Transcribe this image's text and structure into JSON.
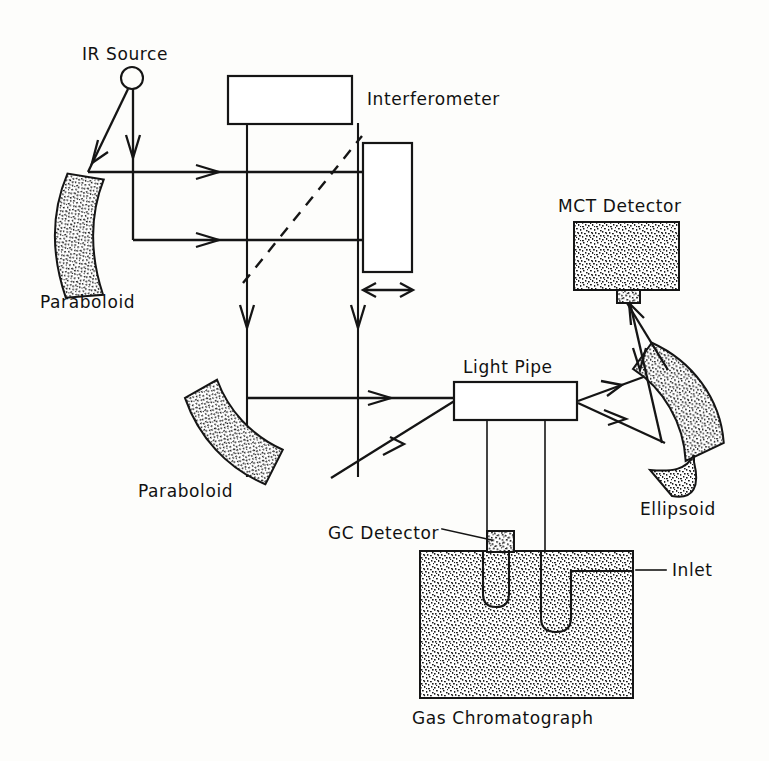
{
  "figure": {
    "background_color": "#fdfdfb",
    "ink_color": "#151515",
    "width": 769,
    "height": 761
  },
  "labels": {
    "ir_source": "IR Source",
    "paraboloid_top": "Paraboloid",
    "interferometer": "Interferometer",
    "mct_detector": "MCT Detector",
    "light_pipe": "Light Pipe",
    "ellipsoid": "Ellipsoid",
    "paraboloid_bottom": "Paraboloid",
    "gc_detector": "GC Detector",
    "inlet": "Inlet",
    "gas_chromatograph": "Gas Chromatograph"
  },
  "components": [
    {
      "name": "ir-source",
      "label": "IR Source",
      "kind": "source",
      "shape": "circle",
      "center": [
        132,
        78
      ],
      "radius": 11
    },
    {
      "name": "paraboloid-top",
      "label": "Paraboloid",
      "kind": "mirror",
      "shape": "curved-band-shaded"
    },
    {
      "name": "interferometer",
      "label": "Interferometer",
      "kind": "module",
      "shape": "rectangle-open",
      "rect": [
        228,
        76,
        124,
        48
      ]
    },
    {
      "name": "moving-mirror",
      "label": "",
      "kind": "translating-mirror",
      "shape": "rectangle-open",
      "rect": [
        363,
        143,
        49,
        129
      ],
      "motion": "bidirectional-horizontal"
    },
    {
      "name": "beam-splitter",
      "label": "",
      "kind": "beamsplitter",
      "shape": "dashed-diagonal-line"
    },
    {
      "name": "paraboloid-bottom",
      "label": "Paraboloid",
      "kind": "mirror",
      "shape": "curved-band-shaded"
    },
    {
      "name": "light-pipe",
      "label": "Light Pipe",
      "kind": "cell",
      "shape": "rectangle-open",
      "rect": [
        454,
        382,
        123,
        38
      ]
    },
    {
      "name": "ellipsoid",
      "label": "Ellipsoid",
      "kind": "mirror",
      "shape": "curved-band-shaded"
    },
    {
      "name": "mct-detector",
      "label": "MCT Detector",
      "kind": "detector",
      "shape": "rectangle-shaded",
      "rect": [
        574,
        222,
        105,
        68
      ]
    },
    {
      "name": "gc-detector",
      "label": "GC Detector",
      "kind": "detector",
      "shape": "rectangle-shaded-small",
      "rect": [
        487,
        531,
        26,
        20
      ]
    },
    {
      "name": "gas-chromatograph",
      "label": "Gas Chromatograph",
      "kind": "oven",
      "shape": "rectangle-shaded",
      "rect": [
        420,
        551,
        213,
        147
      ]
    },
    {
      "name": "inlet",
      "label": "Inlet",
      "kind": "port",
      "shape": "leader-line"
    }
  ],
  "beams": [
    {
      "name": "source-to-paraboloid",
      "from": "ir-source",
      "to": "paraboloid-top",
      "arrow": true
    },
    {
      "name": "source-down",
      "from": "ir-source",
      "to": "lower-beam",
      "arrow": true
    },
    {
      "name": "upper-collimated",
      "from": "paraboloid-top",
      "to": "moving-mirror",
      "arrow": true
    },
    {
      "name": "lower-collimated",
      "from": "paraboloid-top",
      "to": "moving-mirror",
      "arrow": true
    },
    {
      "name": "splitter-down-left",
      "from": "beam-splitter",
      "to": "paraboloid-bottom",
      "arrow": true
    },
    {
      "name": "splitter-down-right",
      "from": "beam-splitter",
      "to": "paraboloid-bottom",
      "arrow": true
    },
    {
      "name": "paraboloid-to-lightpipe-upper",
      "from": "paraboloid-bottom",
      "to": "light-pipe",
      "arrow": true
    },
    {
      "name": "paraboloid-to-lightpipe-lower",
      "from": "paraboloid-bottom",
      "to": "light-pipe",
      "arrow": true
    },
    {
      "name": "lightpipe-to-ellipsoid-upper",
      "from": "light-pipe",
      "to": "ellipsoid",
      "arrow": true
    },
    {
      "name": "lightpipe-to-ellipsoid-lower",
      "from": "light-pipe",
      "to": "ellipsoid",
      "arrow": true
    },
    {
      "name": "ellipsoid-to-mct-upper",
      "from": "ellipsoid",
      "to": "mct-detector",
      "arrow": true
    },
    {
      "name": "ellipsoid-to-mct-lower",
      "from": "ellipsoid",
      "to": "mct-detector",
      "arrow": true
    }
  ],
  "label_positions": {
    "ir_source": [
      82,
      60
    ],
    "paraboloid_top": [
      40,
      308
    ],
    "interferometer": [
      367,
      105
    ],
    "mct_detector": [
      560,
      212
    ],
    "light_pipe": [
      463,
      371
    ],
    "ellipsoid": [
      640,
      513
    ],
    "paraboloid_bottom": [
      140,
      497
    ],
    "gc_detector": [
      330,
      538
    ],
    "inlet": [
      672,
      570
    ],
    "gas_chromatograph": [
      415,
      722
    ]
  }
}
